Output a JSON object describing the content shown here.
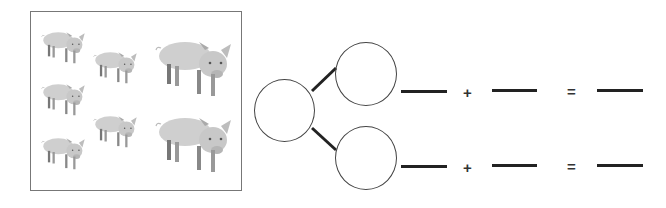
{
  "picture": {
    "subject": "pigs",
    "total_count": 7,
    "groups": [
      {
        "label": "small pigs column 1",
        "count": 3
      },
      {
        "label": "small pigs column 2",
        "count": 2
      },
      {
        "label": "large pigs column 3",
        "count": 2
      }
    ],
    "icon": "pig-icon"
  },
  "number_bond": {
    "whole": "",
    "part_top": "",
    "part_bottom": ""
  },
  "equations": [
    {
      "addend1": "",
      "plus": "+",
      "addend2": "",
      "equals": "=",
      "sum": ""
    },
    {
      "addend1": "",
      "plus": "+",
      "addend2": "",
      "equals": "=",
      "sum": ""
    }
  ],
  "colors": {
    "line": "#222222",
    "circle_border": "#444444",
    "box_border": "#777777"
  }
}
